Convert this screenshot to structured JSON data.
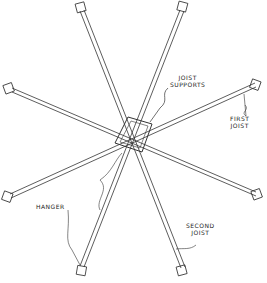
{
  "labels": {
    "joist_supports": [
      "JOIST",
      "SUPPORTS"
    ],
    "first_joist": [
      "FIRST",
      "JOIST"
    ],
    "hanger": "HANGER",
    "second_joist": [
      "SECOND",
      "JOIST"
    ]
  },
  "colors": {
    "line": "#333333",
    "fill": "#ffffff"
  }
}
